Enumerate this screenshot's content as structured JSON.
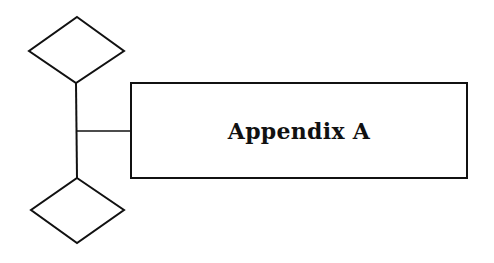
{
  "title": "Appendix A",
  "colors": {
    "stroke": "#111111",
    "background": "#ffffff"
  },
  "shapes": {
    "top_diamond": "diamond",
    "bottom_diamond": "diamond",
    "connector": "vertical-line-with-branch",
    "title_box": "rectangle"
  }
}
